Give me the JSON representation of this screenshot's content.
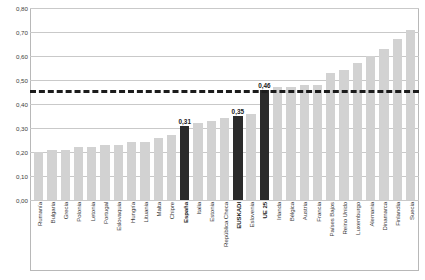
{
  "chart_data": {
    "type": "bar",
    "title": "",
    "subtitle": "",
    "xlabel": "",
    "ylabel": "",
    "ylim": [
      0,
      0.8
    ],
    "ytick_step": 0.1,
    "grid": true,
    "legend": false,
    "decimal_separator": ",",
    "sorted": "ascending",
    "categories": [
      "Rumanía",
      "Bulgaria",
      "Grecia",
      "Polonia",
      "Letonia",
      "Portugal",
      "Eslovaquia",
      "Hungría",
      "Lituania",
      "Malta",
      "Chipre",
      "España",
      "Italia",
      "Estonia",
      "República Checa",
      "EUSKADI",
      "Eslovenia",
      "UE 25",
      "Irlanda",
      "Bélgica",
      "Austria",
      "Francia",
      "Países Bajos",
      "Reino Unido",
      "Luxemburgo",
      "Alemania",
      "Dinamarca",
      "Finlandia",
      "Suecia"
    ],
    "values": [
      0.2,
      0.21,
      0.21,
      0.22,
      0.22,
      0.23,
      0.23,
      0.24,
      0.24,
      0.26,
      0.27,
      0.31,
      0.32,
      0.33,
      0.34,
      0.35,
      0.36,
      0.46,
      0.47,
      0.47,
      0.48,
      0.48,
      0.53,
      0.54,
      0.57,
      0.6,
      0.63,
      0.67,
      0.71
    ],
    "highlighted": [
      "España",
      "EUSKADI",
      "UE 25"
    ],
    "data_labels": {
      "España": "0,31",
      "EUSKADI": "0,35",
      "UE 25": "0,46"
    },
    "colors": {
      "bar": "#d2d2d2",
      "bar_highlight": "#2b2b2b",
      "gridline": "#c9c9c9",
      "reference_line": "#1c1c1c",
      "frame": "#b8b8b8",
      "text": "#3a3a3a"
    },
    "reference_line": {
      "value": 0.46,
      "label": "0,46",
      "style": "dashed"
    },
    "ytick_labels": [
      "0,00",
      "0,10",
      "0,20",
      "0,30",
      "0,40",
      "0,50",
      "0,60",
      "0,70",
      "0,80"
    ],
    "ytick_values": [
      0.0,
      0.1,
      0.2,
      0.3,
      0.4,
      0.5,
      0.6,
      0.7,
      0.8
    ]
  }
}
